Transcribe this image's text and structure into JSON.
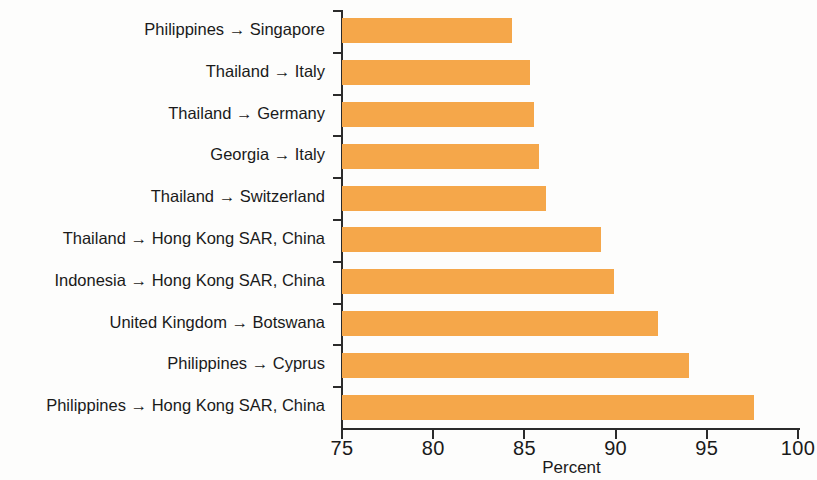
{
  "chart_data": {
    "type": "bar",
    "orientation": "horizontal",
    "title": "",
    "xlabel": "Percent",
    "ylabel": "",
    "xlim": [
      75,
      100
    ],
    "xticks": [
      75,
      80,
      85,
      90,
      95,
      100
    ],
    "xtick_labels": [
      "75",
      "80",
      "85",
      "90",
      "95",
      "100"
    ],
    "grid": false,
    "legend": null,
    "bar_color": "#f5a74a",
    "axis_color": "#2b2b2b",
    "categories": [
      "Philippines → Singapore",
      "Thailand → Italy",
      "Thailand → Germany",
      "Georgia → Italy",
      "Thailand → Switzerland",
      "Thailand → Hong Kong SAR, China",
      "Indonesia → Hong Kong SAR, China",
      "United Kingdom → Botswana",
      "Philippines → Cyprus",
      "Philippines → Hong Kong SAR, China"
    ],
    "values": [
      84.3,
      85.3,
      85.5,
      85.8,
      86.2,
      89.2,
      89.9,
      92.3,
      94.0,
      97.6
    ]
  }
}
